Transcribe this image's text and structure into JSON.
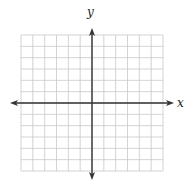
{
  "diagram": {
    "type": "cartesian-coordinate-grid",
    "x_label": "x",
    "y_label": "y",
    "grid": {
      "columns": 12,
      "rows": 12,
      "columns_left_of_y_axis": 6,
      "columns_right_of_y_axis": 6,
      "rows_above_x_axis": 6,
      "rows_below_x_axis": 6,
      "left": 21,
      "right": 163,
      "top": 35,
      "bottom": 171
    },
    "axes": {
      "origin_px": [
        92,
        103
      ],
      "x_axis_extent_px": [
        10,
        174
      ],
      "y_axis_extent_px": [
        28,
        180
      ],
      "arrows": "both-ends"
    },
    "colors": {
      "grid": "#c8c8c8",
      "axis": "#333333",
      "background": "#ffffff"
    }
  }
}
